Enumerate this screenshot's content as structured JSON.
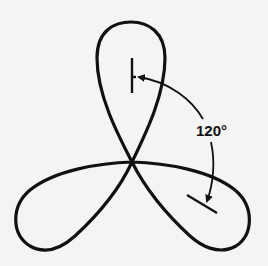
{
  "diagram": {
    "type": "three-lobed rose curve (trefoil)",
    "lobes": 3,
    "rotation_annotation": {
      "label": "120°",
      "description": "Curved arrow indicating 120° rotation from top lobe axis marker to lower-right lobe axis marker"
    },
    "colors": {
      "stroke": "#111111",
      "background": "#f4f4f2"
    }
  }
}
